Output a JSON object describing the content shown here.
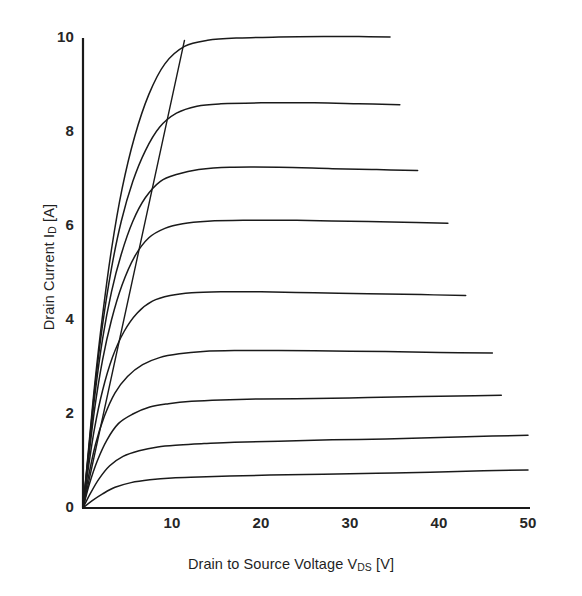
{
  "chart_data": {
    "type": "line",
    "title": "",
    "xlabel_parts": {
      "pre": "Drain to Source Voltage  V",
      "sub": "DS",
      "post": " [V]"
    },
    "xlabel": "Drain to Source Voltage  VDS [V]",
    "ylabel_parts": {
      "pre": "Drain Current  I",
      "sub": "D",
      "post": " [A]"
    },
    "ylabel": "Drain Current  ID [A]",
    "xlim": [
      0,
      50
    ],
    "ylim": [
      0,
      10
    ],
    "xticks": [
      0,
      10,
      20,
      30,
      40,
      50
    ],
    "xtick_labels": [
      "0",
      "10",
      "20",
      "30",
      "40",
      "50"
    ],
    "yticks": [
      0,
      2,
      4,
      6,
      8,
      10
    ],
    "ytick_labels": [
      "0",
      "2",
      "4",
      "6",
      "8",
      "10"
    ],
    "grid": false,
    "legend": "none",
    "series": [
      {
        "name": "curve-1",
        "saturation_current": 10.0,
        "points": [
          [
            0,
            0
          ],
          [
            0.6,
            1.2
          ],
          [
            1.3,
            2.6
          ],
          [
            2.2,
            4.1
          ],
          [
            3.2,
            5.5
          ],
          [
            4.4,
            6.8
          ],
          [
            5.8,
            7.9
          ],
          [
            7.4,
            8.8
          ],
          [
            9.2,
            9.45
          ],
          [
            11.4,
            9.82
          ],
          [
            14.0,
            9.95
          ],
          [
            17.5,
            10.0
          ],
          [
            22.0,
            10.02
          ],
          [
            27.0,
            10.03
          ],
          [
            31.0,
            10.03
          ],
          [
            34.5,
            10.02
          ]
        ]
      },
      {
        "name": "curve-2",
        "saturation_current": 8.55,
        "points": [
          [
            0,
            0
          ],
          [
            0.6,
            1.15
          ],
          [
            1.3,
            2.5
          ],
          [
            2.2,
            3.9
          ],
          [
            3.2,
            5.1
          ],
          [
            4.3,
            6.1
          ],
          [
            5.6,
            6.95
          ],
          [
            7.0,
            7.6
          ],
          [
            8.6,
            8.1
          ],
          [
            10.5,
            8.4
          ],
          [
            12.8,
            8.55
          ],
          [
            15.5,
            8.6
          ],
          [
            20.0,
            8.62
          ],
          [
            26.0,
            8.62
          ],
          [
            31.0,
            8.6
          ],
          [
            35.6,
            8.58
          ]
        ]
      },
      {
        "name": "curve-3",
        "saturation_current": 7.15,
        "points": [
          [
            0,
            0
          ],
          [
            0.6,
            1.1
          ],
          [
            1.3,
            2.35
          ],
          [
            2.2,
            3.6
          ],
          [
            3.2,
            4.6
          ],
          [
            4.3,
            5.4
          ],
          [
            5.6,
            6.1
          ],
          [
            7.0,
            6.6
          ],
          [
            8.7,
            6.95
          ],
          [
            10.6,
            7.1
          ],
          [
            13.0,
            7.2
          ],
          [
            16.5,
            7.25
          ],
          [
            22.0,
            7.25
          ],
          [
            28.0,
            7.22
          ],
          [
            33.0,
            7.2
          ],
          [
            37.6,
            7.18
          ]
        ]
      },
      {
        "name": "curve-4",
        "saturation_current": 6.05,
        "points": [
          [
            0,
            0
          ],
          [
            0.6,
            1.0
          ],
          [
            1.3,
            2.1
          ],
          [
            2.2,
            3.15
          ],
          [
            3.2,
            4.0
          ],
          [
            4.4,
            4.75
          ],
          [
            5.8,
            5.35
          ],
          [
            7.4,
            5.75
          ],
          [
            9.2,
            5.95
          ],
          [
            11.2,
            6.05
          ],
          [
            14.0,
            6.1
          ],
          [
            18.0,
            6.12
          ],
          [
            24.0,
            6.12
          ],
          [
            30.0,
            6.1
          ],
          [
            36.0,
            6.08
          ],
          [
            41.0,
            6.06
          ]
        ]
      },
      {
        "name": "curve-5",
        "saturation_current": 4.5,
        "points": [
          [
            0,
            0
          ],
          [
            0.6,
            0.85
          ],
          [
            1.3,
            1.7
          ],
          [
            2.2,
            2.5
          ],
          [
            3.3,
            3.2
          ],
          [
            4.6,
            3.75
          ],
          [
            6.1,
            4.15
          ],
          [
            7.8,
            4.4
          ],
          [
            9.8,
            4.52
          ],
          [
            12.2,
            4.58
          ],
          [
            15.5,
            4.6
          ],
          [
            20.0,
            4.6
          ],
          [
            26.0,
            4.58
          ],
          [
            32.0,
            4.56
          ],
          [
            38.0,
            4.54
          ],
          [
            43.0,
            4.52
          ]
        ]
      },
      {
        "name": "curve-6",
        "saturation_current": 3.28,
        "points": [
          [
            0,
            0
          ],
          [
            0.6,
            0.65
          ],
          [
            1.4,
            1.35
          ],
          [
            2.4,
            1.95
          ],
          [
            3.6,
            2.45
          ],
          [
            5.0,
            2.8
          ],
          [
            6.7,
            3.05
          ],
          [
            8.6,
            3.2
          ],
          [
            10.8,
            3.28
          ],
          [
            13.5,
            3.33
          ],
          [
            17.0,
            3.35
          ],
          [
            22.0,
            3.35
          ],
          [
            28.0,
            3.34
          ],
          [
            34.0,
            3.33
          ],
          [
            40.0,
            3.31
          ],
          [
            46.0,
            3.3
          ]
        ]
      },
      {
        "name": "curve-7",
        "saturation_current": 2.3,
        "points": [
          [
            0,
            0
          ],
          [
            0.7,
            0.5
          ],
          [
            1.6,
            1.0
          ],
          [
            2.7,
            1.45
          ],
          [
            4.0,
            1.8
          ],
          [
            5.6,
            2.0
          ],
          [
            7.5,
            2.15
          ],
          [
            9.6,
            2.22
          ],
          [
            12.2,
            2.27
          ],
          [
            15.5,
            2.3
          ],
          [
            20.0,
            2.32
          ],
          [
            26.0,
            2.33
          ],
          [
            32.0,
            2.35
          ],
          [
            38.0,
            2.37
          ],
          [
            44.0,
            2.39
          ],
          [
            47.0,
            2.4
          ]
        ]
      },
      {
        "name": "curve-8",
        "saturation_current": 1.45,
        "points": [
          [
            0,
            0
          ],
          [
            0.8,
            0.3
          ],
          [
            1.8,
            0.62
          ],
          [
            3.0,
            0.9
          ],
          [
            4.5,
            1.1
          ],
          [
            6.3,
            1.22
          ],
          [
            8.4,
            1.3
          ],
          [
            10.8,
            1.34
          ],
          [
            13.6,
            1.37
          ],
          [
            17.0,
            1.4
          ],
          [
            22.0,
            1.42
          ],
          [
            28.0,
            1.45
          ],
          [
            34.0,
            1.47
          ],
          [
            40.0,
            1.5
          ],
          [
            46.0,
            1.53
          ],
          [
            50.0,
            1.55
          ]
        ]
      },
      {
        "name": "curve-9",
        "saturation_current": 0.7,
        "points": [
          [
            0,
            0
          ],
          [
            1.0,
            0.15
          ],
          [
            2.2,
            0.3
          ],
          [
            3.6,
            0.44
          ],
          [
            5.4,
            0.54
          ],
          [
            7.5,
            0.6
          ],
          [
            10.0,
            0.64
          ],
          [
            13.0,
            0.66
          ],
          [
            16.5,
            0.68
          ],
          [
            21.0,
            0.7
          ],
          [
            27.0,
            0.72
          ],
          [
            33.0,
            0.74
          ],
          [
            39.0,
            0.76
          ],
          [
            45.0,
            0.79
          ],
          [
            50.0,
            0.81
          ]
        ]
      }
    ],
    "annotations": [
      {
        "name": "knee-locus-line",
        "description": "straight boundary line from origin through the knees of the curves",
        "points": [
          [
            0,
            0
          ],
          [
            11.4,
            9.95
          ]
        ]
      }
    ]
  },
  "axes": {
    "x_origin_px": 83,
    "x_end_px": 528,
    "y_origin_px": 508,
    "y_top_px": 38
  }
}
